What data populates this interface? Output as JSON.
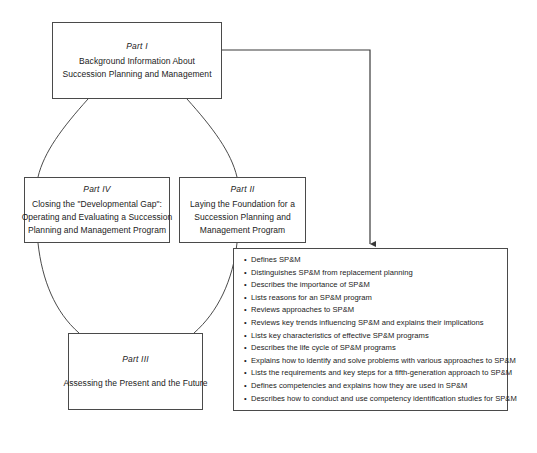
{
  "diagram": {
    "line_color": "#4a4a4a",
    "text_color": "#1b1b1b",
    "background": "#ffffff"
  },
  "nodes": {
    "part1": {
      "part": "Part I",
      "lines": [
        "Background Information About",
        "Succession Planning and Management"
      ]
    },
    "part2": {
      "part": "Part II",
      "lines": [
        "Laying the Foundation for a",
        "Succession Planning and",
        "Management Program"
      ]
    },
    "part3": {
      "part": "Part III",
      "lines": [
        "Assessing the Present and the Future"
      ]
    },
    "part4": {
      "part": "Part IV",
      "lines": [
        "Closing the \"Developmental Gap\":",
        "Operating and Evaluating a Succession",
        "Planning and Management Program"
      ]
    }
  },
  "detail_panel": {
    "bullet_glyph": "•",
    "items": [
      "Defines SP&M",
      "Distinguishes SP&M from replacement planning",
      "Describes the importance of SP&M",
      "Lists reasons for an SP&M program",
      "Reviews approaches to SP&M",
      "Reviews key trends influencing SP&M and explains their implications",
      "Lists key characteristics of effective SP&M programs",
      "Describes the life cycle of SP&M programs",
      "Explains how to identify and solve problems with various approaches to SP&M",
      "Lists the requirements and key steps for a fifth-generation approach to SP&M",
      "Defines competencies and explains how they are used in SP&M",
      "Describes how to conduct and use competency identification studies for SP&M"
    ]
  }
}
